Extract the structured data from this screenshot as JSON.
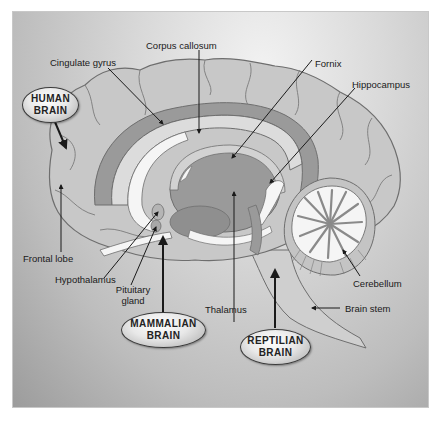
{
  "diagram": {
    "colors": {
      "background_light": "#f2f2f2",
      "background_dark": "#9c9c9c",
      "cortex": "#c6c6c6",
      "limbic": "#9a9a9a",
      "white_matter": "#f5f5f5",
      "outline": "#6e6e6e",
      "arrow": "#1a1a1a"
    },
    "brain_regions": [
      {
        "id": "human",
        "label_line1": "HUMAN",
        "label_line2": "BRAIN"
      },
      {
        "id": "mammalian",
        "label_line1": "MAMMALIAN",
        "label_line2": "BRAIN"
      },
      {
        "id": "reptilian",
        "label_line1": "REPTILIAN",
        "label_line2": "BRAIN"
      }
    ],
    "labels": {
      "corpus_callosum": "Corpus callosum",
      "cingulate_gyrus": "Cingulate gyrus",
      "fornix": "Fornix",
      "hippocampus": "Hippocampus",
      "frontal_lobe": "Frontal lobe",
      "hypothalamus": "Hypothalamus",
      "pituitary_line1": "Pituitary",
      "pituitary_line2": "gland",
      "thalamus": "Thalamus",
      "cerebellum": "Cerebellum",
      "brain_stem": "Brain stem"
    }
  }
}
